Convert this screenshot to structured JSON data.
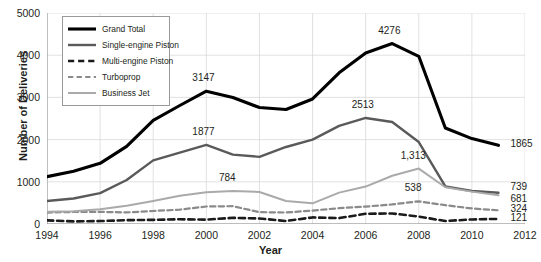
{
  "chart_data": {
    "type": "line",
    "title": "",
    "xlabel": "Year",
    "ylabel": "Number of Deliveries",
    "xlim": [
      1994,
      2012
    ],
    "ylim": [
      0,
      5000
    ],
    "grid": true,
    "legend_position": "top-left",
    "x": [
      1994,
      1995,
      1996,
      1997,
      1998,
      1999,
      2000,
      2001,
      2002,
      2003,
      2004,
      2005,
      2006,
      2007,
      2008,
      2009,
      2010,
      2011
    ],
    "xticks": [
      "1994",
      "1996",
      "1998",
      "2000",
      "2002",
      "2004",
      "2006",
      "2008",
      "2010",
      "2012"
    ],
    "yticks": [
      "0",
      "1000",
      "2000",
      "3000",
      "4000",
      "5000"
    ],
    "series": [
      {
        "name": "Grand Total",
        "color": "#000000",
        "style": "solid",
        "width": 3.1,
        "values": [
          1123,
          1251,
          1437,
          1840,
          2457,
          2808,
          3147,
          2998,
          2760,
          2712,
          2963,
          3583,
          4054,
          4276,
          3974,
          2276,
          2024,
          1865
        ]
      },
      {
        "name": "Single-engine Piston",
        "color": "#5a5a5a",
        "style": "solid",
        "width": 2.4,
        "values": [
          544,
          605,
          731,
          1043,
          1508,
          1689,
          1877,
          1645,
          1591,
          1825,
          1999,
          2326,
          2513,
          2417,
          1943,
          889,
          781,
          739
        ]
      },
      {
        "name": "Multi-engine Piston",
        "color": "#1a1a1a",
        "style": "dashed",
        "width": 2.6,
        "values": [
          87,
          61,
          70,
          91,
          98,
          112,
          103,
          147,
          130,
          71,
          156,
          139,
          242,
          250,
          176,
          70,
          108,
          121
        ]
      },
      {
        "name": "Turboprop",
        "color": "#8a8a8a",
        "style": "dashed",
        "width": 2.2,
        "values": [
          271,
          285,
          287,
          274,
          308,
          340,
          415,
          422,
          280,
          272,
          319,
          375,
          412,
          465,
          538,
          446,
          368,
          324
        ]
      },
      {
        "name": "Business Jet",
        "color": "#aaaaaa",
        "style": "solid",
        "width": 2.0,
        "values": [
          288,
          300,
          349,
          432,
          543,
          667,
          752,
          784,
          759,
          544,
          489,
          743,
          887,
          1144,
          1313,
          871,
          767,
          681
        ]
      }
    ],
    "annotations": [
      {
        "text": "3147",
        "x": 2000,
        "y": 3147,
        "dx": 0,
        "dy": -13
      },
      {
        "text": "1877",
        "x": 2000,
        "y": 1877,
        "dx": 0,
        "dy": -13
      },
      {
        "text": "784",
        "x": 2001,
        "y": 784,
        "dx": 0,
        "dy": -13
      },
      {
        "text": "4276",
        "x": 2007,
        "y": 4276,
        "dx": 0,
        "dy": -13
      },
      {
        "text": "2513",
        "x": 2006,
        "y": 2513,
        "dx": 0,
        "dy": -13
      },
      {
        "text": "1,313",
        "x": 2008,
        "y": 1313,
        "dx": -2,
        "dy": -13
      },
      {
        "text": "538",
        "x": 2008,
        "y": 538,
        "dx": 0,
        "dy": -13
      },
      {
        "text": "1865",
        "x": 2011,
        "y": 1865,
        "dx": 12,
        "dy": 0
      },
      {
        "text": "739",
        "x": 2011,
        "y": 739,
        "dx": 12,
        "dy": -5
      },
      {
        "text": "681",
        "x": 2011,
        "y": 681,
        "dx": 12,
        "dy": 5
      },
      {
        "text": "324",
        "x": 2011,
        "y": 324,
        "dx": 12,
        "dy": 0
      },
      {
        "text": "121",
        "x": 2011,
        "y": 121,
        "dx": 12,
        "dy": 0
      }
    ]
  }
}
